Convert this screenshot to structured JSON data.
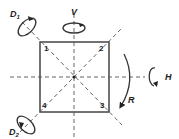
{
  "diagram": {
    "vertices": [
      {
        "label": "1",
        "position": "top-left"
      },
      {
        "label": "2",
        "position": "top-right"
      },
      {
        "label": "3",
        "position": "bottom-right"
      },
      {
        "label": "4",
        "position": "bottom-left"
      }
    ],
    "axes": [
      {
        "label": "D1",
        "main": "D",
        "sub": "1",
        "type": "diagonal through 1 and 3"
      },
      {
        "label": "D2",
        "main": "D",
        "sub": "2",
        "type": "diagonal through 4 and 2"
      },
      {
        "label": "V",
        "type": "vertical"
      },
      {
        "label": "H",
        "type": "horizontal"
      },
      {
        "label": "R",
        "type": "rotation about center"
      }
    ],
    "colors": {
      "line": "#333333",
      "background": "#ffffff"
    }
  }
}
